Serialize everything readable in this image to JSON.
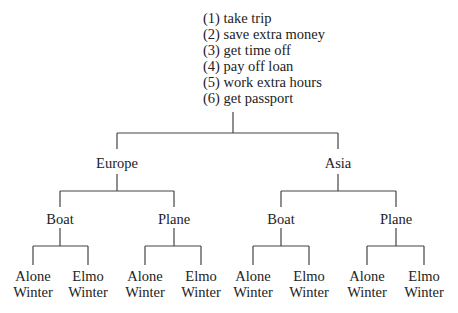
{
  "root": {
    "goals": [
      "(1) take trip",
      "(2) save extra money",
      "(3) get time off",
      "(4) pay off loan",
      "(5) work extra hours",
      "(6) get passport"
    ]
  },
  "level1": [
    {
      "label": "Europe"
    },
    {
      "label": "Asia"
    }
  ],
  "level2": [
    {
      "label": "Boat"
    },
    {
      "label": "Plane"
    },
    {
      "label": "Boat"
    },
    {
      "label": "Plane"
    }
  ],
  "leaves": [
    {
      "line1": "Alone",
      "line2": "Winter"
    },
    {
      "line1": "Elmo",
      "line2": "Winter"
    },
    {
      "line1": "Alone",
      "line2": "Winter"
    },
    {
      "line1": "Elmo",
      "line2": "Winter"
    },
    {
      "line1": "Alone",
      "line2": "Winter"
    },
    {
      "line1": "Elmo",
      "line2": "Winter"
    },
    {
      "line1": "Alone",
      "line2": "Winter"
    },
    {
      "line1": "Elmo",
      "line2": "Winter"
    }
  ]
}
